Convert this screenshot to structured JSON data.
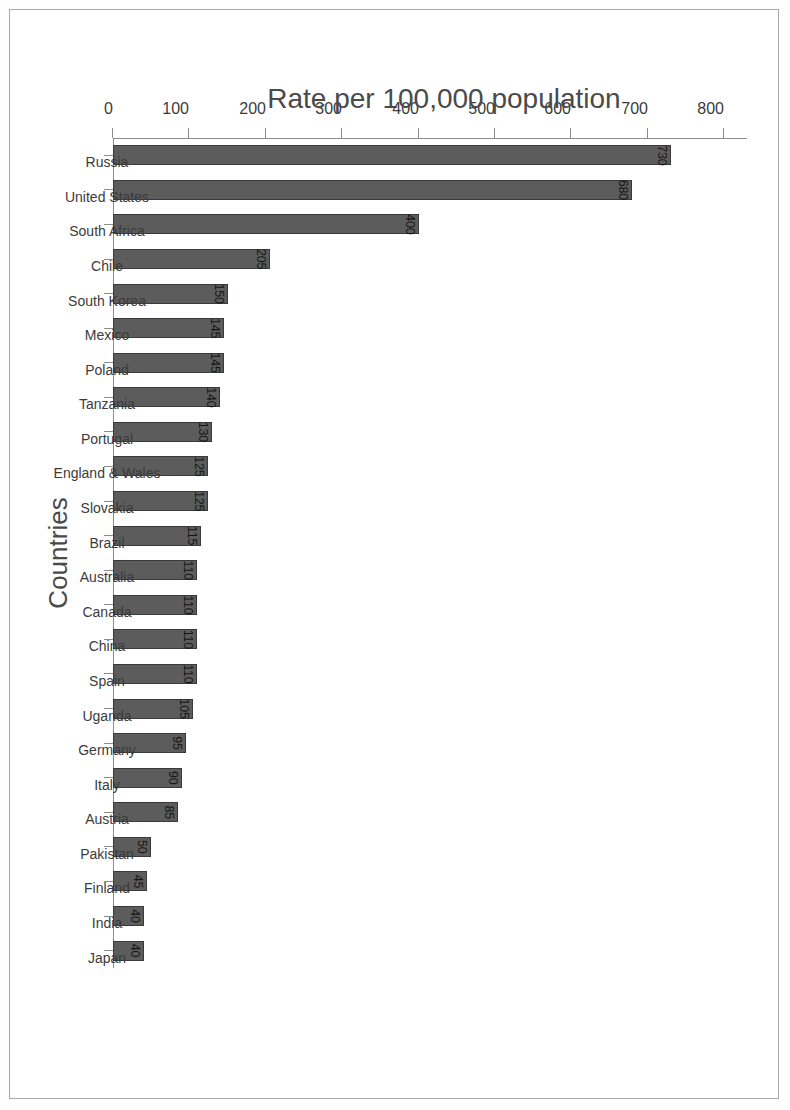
{
  "chart_data": {
    "type": "bar",
    "title": "",
    "subtitle": "",
    "orientation": "vertical-rotated-90ccw",
    "xlabel": "Countries",
    "ylabel": "Rate per 100,000 population",
    "ylim": [
      0,
      830
    ],
    "yticks": [
      0,
      100,
      200,
      300,
      400,
      500,
      600,
      700,
      800
    ],
    "ytick_labels": [
      "0",
      "100",
      "200",
      "300",
      "400",
      "500",
      "600",
      "700",
      "800"
    ],
    "grid": false,
    "legend": null,
    "bar_color": "#5c5c5c",
    "bar_edge_color": "#3a3a3a",
    "axis_color": "#8d8d8d",
    "label_color": "#3b3b3b",
    "value_label_color": "#161616",
    "categories": [
      "Russia",
      "United States",
      "South Africa",
      "Chile",
      "South Korea",
      "Mexico",
      "Poland",
      "Tanzania",
      "Portugal",
      "England & Wales",
      "Slovakia",
      "Brazil",
      "Australia",
      "Canada",
      "China",
      "Spain",
      "Uganda",
      "Germany",
      "Italy",
      "Austria",
      "Pakistan",
      "Finland",
      "India",
      "Japan"
    ],
    "values": [
      730,
      680,
      400,
      205,
      150,
      145,
      145,
      140,
      130,
      125,
      125,
      115,
      110,
      110,
      110,
      110,
      105,
      95,
      90,
      85,
      50,
      45,
      40,
      40
    ],
    "value_labels": [
      "730",
      "680",
      "400",
      "205",
      "150",
      "145",
      "145",
      "140",
      "130",
      "125",
      "125",
      "115",
      "110",
      "110",
      "110",
      "110",
      "105",
      "95",
      "90",
      "85",
      "50",
      "45",
      "40",
      "40"
    ]
  }
}
